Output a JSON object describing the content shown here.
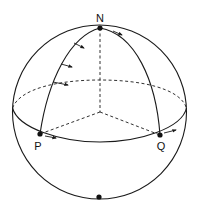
{
  "diagram": {
    "type": "sphere-parallel-transport",
    "labels": {
      "north": "N",
      "p": "P",
      "q": "Q"
    },
    "colors": {
      "stroke": "#1a1a1a",
      "background": "#ffffff"
    }
  }
}
